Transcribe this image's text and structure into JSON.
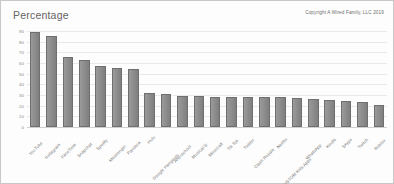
{
  "chart_data": {
    "type": "bar",
    "title": "Percentage",
    "xlabel": "",
    "ylabel": "",
    "ylim": [
      0,
      90
    ],
    "yticks": [
      0,
      10,
      20,
      30,
      40,
      50,
      60,
      70,
      80,
      90
    ],
    "grid": true,
    "legend": false,
    "bar_color": "#8c8c8c",
    "categories": [
      "YouTube",
      "Instagram",
      "FaceTime",
      "Snapchat",
      "Spotify",
      "Messenger",
      "Pandora",
      "Hulu",
      "Google Hangouts",
      "Afterschool",
      "Musical.ly",
      "Minecraft",
      "Tik Tok",
      "Twitter",
      "Clash Royale",
      "Netflix",
      "CUSTOM Kids Apps",
      "WhatsApp",
      "Kindle",
      "Skype",
      "Twitch",
      "Roblox"
    ],
    "values": [
      89,
      85,
      66,
      63,
      57,
      55,
      54,
      32,
      31,
      29,
      29,
      28,
      28,
      28,
      28,
      28,
      27,
      26,
      25,
      24,
      23,
      21
    ]
  },
  "header": {
    "copyright": "Copyright A Wired Family, LLC 2019"
  }
}
